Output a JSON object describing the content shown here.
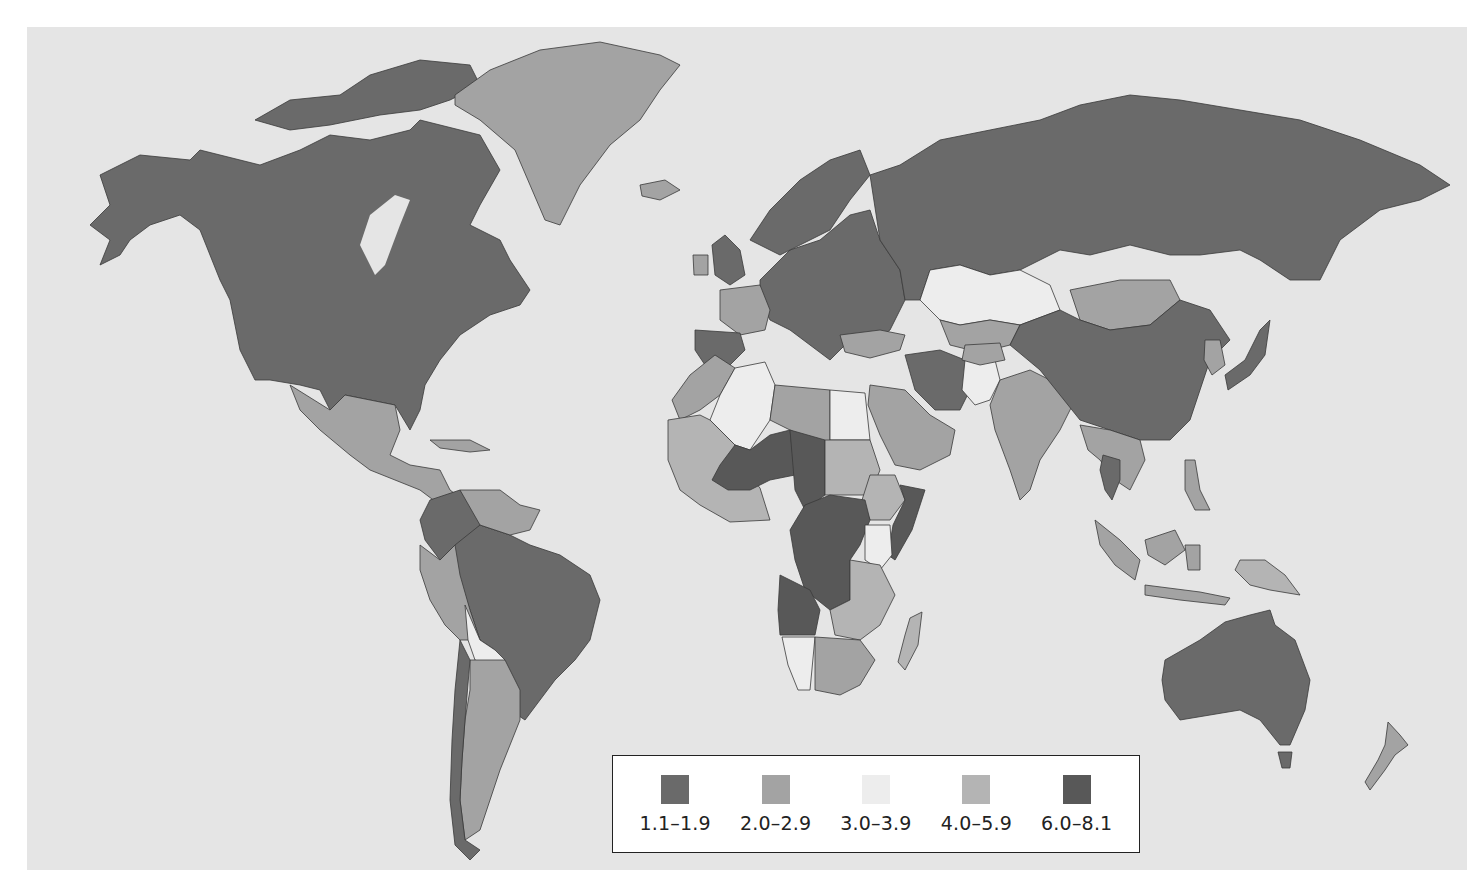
{
  "map": {
    "type": "choropleth",
    "projection": "world (Robinson-like)",
    "background_color": "#e5e5e5",
    "classes": [
      {
        "id": "c1",
        "label": "1.1–1.9",
        "color": "#6a6a6a"
      },
      {
        "id": "c2",
        "label": "2.0–2.9",
        "color": "#a3a3a3"
      },
      {
        "id": "c3",
        "label": "3.0–3.9",
        "color": "#ededed"
      },
      {
        "id": "c4",
        "label": "4.0–5.9",
        "color": "#b4b4b4"
      },
      {
        "id": "c5",
        "label": "6.0–8.1",
        "color": "#585858"
      }
    ],
    "regions": [
      {
        "name": "United States",
        "class": "1.1–1.9"
      },
      {
        "name": "Canada",
        "class": "1.1–1.9"
      },
      {
        "name": "Alaska",
        "class": "1.1–1.9"
      },
      {
        "name": "Greenland",
        "class": "2.0–2.9"
      },
      {
        "name": "Iceland",
        "class": "2.0–2.9"
      },
      {
        "name": "Mexico",
        "class": "2.0–2.9"
      },
      {
        "name": "Central America",
        "class": "2.0–2.9"
      },
      {
        "name": "Colombia",
        "class": "1.1–1.9"
      },
      {
        "name": "Venezuela",
        "class": "2.0–2.9"
      },
      {
        "name": "Brazil",
        "class": "1.1–1.9"
      },
      {
        "name": "Peru",
        "class": "2.0–2.9"
      },
      {
        "name": "Ecuador",
        "class": "2.0–2.9"
      },
      {
        "name": "Bolivia",
        "class": "3.0–3.9"
      },
      {
        "name": "Paraguay",
        "class": "2.0–2.9"
      },
      {
        "name": "Argentina",
        "class": "2.0–2.9"
      },
      {
        "name": "Chile",
        "class": "1.1–1.9"
      },
      {
        "name": "Uruguay",
        "class": "1.1–1.9"
      },
      {
        "name": "Europe",
        "class": "1.1–1.9"
      },
      {
        "name": "France",
        "class": "2.0–2.9"
      },
      {
        "name": "Ireland",
        "class": "2.0–2.9"
      },
      {
        "name": "Russia",
        "class": "1.1–1.9"
      },
      {
        "name": "Kazakhstan",
        "class": "3.0–3.9"
      },
      {
        "name": "Mongolia",
        "class": "2.0–2.9"
      },
      {
        "name": "China",
        "class": "1.1–1.9"
      },
      {
        "name": "Japan",
        "class": "1.1–1.9"
      },
      {
        "name": "Turkey",
        "class": "2.0–2.9"
      },
      {
        "name": "Iran",
        "class": "1.1–1.9"
      },
      {
        "name": "Saudi Arabia",
        "class": "2.0–2.9"
      },
      {
        "name": "Pakistan",
        "class": "3.0–3.9"
      },
      {
        "name": "India",
        "class": "2.0–2.9"
      },
      {
        "name": "Thailand",
        "class": "1.1–1.9"
      },
      {
        "name": "Southeast Asia",
        "class": "2.0–2.9"
      },
      {
        "name": "Indonesia",
        "class": "2.0–2.9"
      },
      {
        "name": "Papua New Guinea",
        "class": "4.0–5.9"
      },
      {
        "name": "Australia",
        "class": "1.1–1.9"
      },
      {
        "name": "New Zealand",
        "class": "2.0–2.9"
      },
      {
        "name": "Algeria",
        "class": "3.0–3.9"
      },
      {
        "name": "Libya",
        "class": "2.0–2.9"
      },
      {
        "name": "Egypt",
        "class": "3.0–3.9"
      },
      {
        "name": "West Africa",
        "class": "4.0–5.9"
      },
      {
        "name": "Niger",
        "class": "6.0–8.1"
      },
      {
        "name": "Chad",
        "class": "6.0–8.1"
      },
      {
        "name": "Mali",
        "class": "6.0–8.1"
      },
      {
        "name": "Sudan",
        "class": "4.0–5.9"
      },
      {
        "name": "South Sudan",
        "class": "6.0–8.1"
      },
      {
        "name": "Ethiopia",
        "class": "4.0–5.9"
      },
      {
        "name": "Somalia",
        "class": "6.0–8.1"
      },
      {
        "name": "DR Congo",
        "class": "6.0–8.1"
      },
      {
        "name": "Angola",
        "class": "6.0–8.1"
      },
      {
        "name": "Kenya",
        "class": "3.0–3.9"
      },
      {
        "name": "Tanzania",
        "class": "4.0–5.9"
      },
      {
        "name": "Southern Africa",
        "class": "2.0–2.9"
      },
      {
        "name": "Namibia",
        "class": "3.0–3.9"
      },
      {
        "name": "Madagascar",
        "class": "4.0–5.9"
      }
    ]
  },
  "legend": {
    "items": [
      {
        "label": "1.1–1.9",
        "color": "#6a6a6a"
      },
      {
        "label": "2.0–2.9",
        "color": "#a3a3a3"
      },
      {
        "label": "3.0–3.9",
        "color": "#ededed"
      },
      {
        "label": "4.0–5.9",
        "color": "#b4b4b4"
      },
      {
        "label": "6.0–8.1",
        "color": "#585858"
      }
    ]
  }
}
